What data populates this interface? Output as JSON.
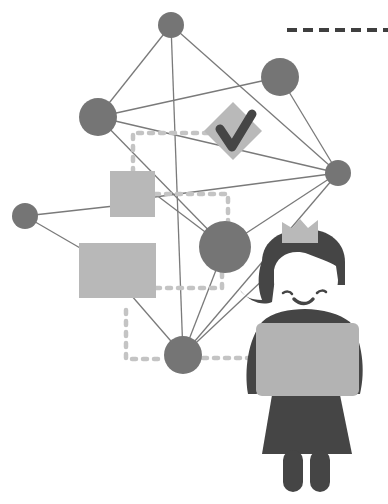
{
  "illustration": {
    "title": "Network diagram with girl holding a blank sign",
    "colors": {
      "background": "#ffffff",
      "node": "#757575",
      "line": "#7a7a7a",
      "box": "#b8b8b8",
      "dotted": "#c4c4c4",
      "dark": "#454545",
      "crown": "#b9b9b9",
      "sign": "#b3b3b3",
      "face": "#ffffff"
    },
    "nodes": [
      {
        "id": "top",
        "cx": 171,
        "cy": 25,
        "r": 13
      },
      {
        "id": "top-right",
        "cx": 280,
        "cy": 77,
        "r": 19
      },
      {
        "id": "left-mid",
        "cx": 98,
        "cy": 117,
        "r": 19
      },
      {
        "id": "right",
        "cx": 338,
        "cy": 173,
        "r": 13
      },
      {
        "id": "far-left",
        "cx": 25,
        "cy": 216,
        "r": 13
      },
      {
        "id": "center",
        "cx": 225,
        "cy": 247,
        "r": 26
      },
      {
        "id": "bottom",
        "cx": 183,
        "cy": 355,
        "r": 19
      }
    ],
    "boxes": [
      {
        "id": "small-square",
        "x": 110,
        "y": 171,
        "w": 45,
        "h": 46
      },
      {
        "id": "large-square",
        "x": 79,
        "y": 243,
        "w": 77,
        "h": 55
      }
    ],
    "checkmark_badge": {
      "cx": 233,
      "cy": 131,
      "half": 29,
      "glyph": "check-icon"
    },
    "dashed_rule": {
      "x1": 285,
      "x2": 388,
      "y": 30
    },
    "figure": {
      "label": "girl with crown holding blank sign",
      "sign_text": ""
    }
  }
}
